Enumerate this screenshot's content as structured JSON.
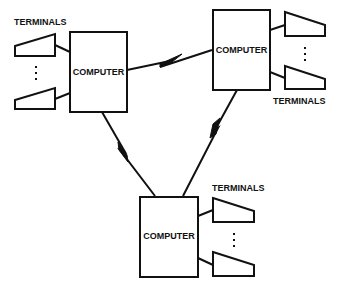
{
  "diagram": {
    "type": "network-topology",
    "nodes": [
      {
        "id": "computer-left",
        "label": "COMPUTER",
        "terminals_label": "TERMINALS"
      },
      {
        "id": "computer-right",
        "label": "COMPUTER",
        "terminals_label": "TERMINALS"
      },
      {
        "id": "computer-bottom",
        "label": "COMPUTER",
        "terminals_label": "TERMINALS"
      }
    ],
    "links": [
      {
        "from": "computer-left",
        "to": "computer-right",
        "style": "lightning"
      },
      {
        "from": "computer-left",
        "to": "computer-bottom",
        "style": "lightning"
      },
      {
        "from": "computer-right",
        "to": "computer-bottom",
        "style": "lightning"
      }
    ],
    "ellipsis": "⋮",
    "stroke_color": "#111111"
  }
}
